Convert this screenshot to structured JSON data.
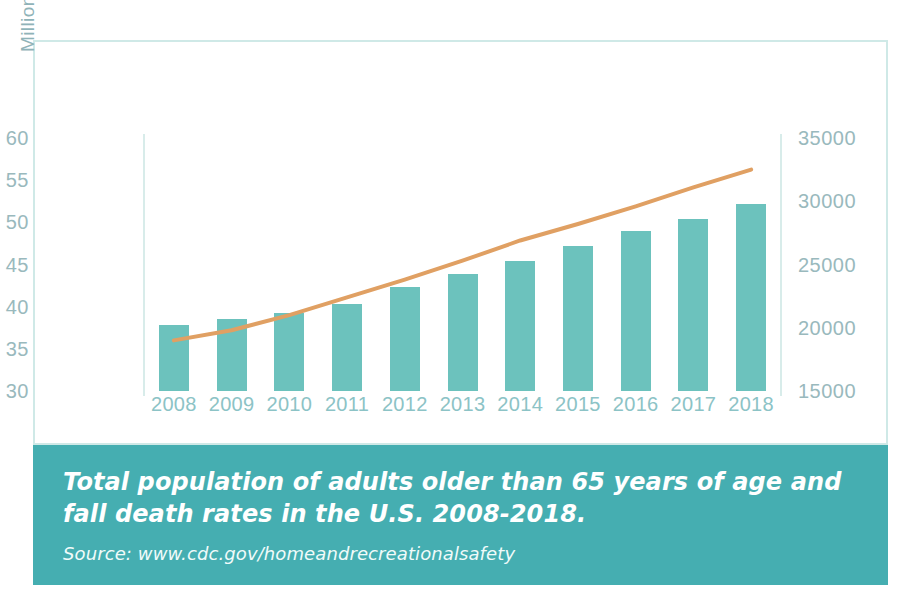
{
  "figure": {
    "caption_title": "Total population of adults older than 65 years of age and fall death rates in the U.S. 2008-2018.",
    "caption_source": "Source: www.cdc.gov/homeandrecreationalsafety"
  },
  "colors": {
    "bar": "#6cc2bd",
    "line": "#e0a063",
    "caption_background": "#45aeb1",
    "caption_text": "#ffffff",
    "axis_text": "#99b9bd",
    "xtick_text": "#8cc3c6",
    "frame": "#cfe9e7"
  },
  "chart_data": {
    "type": "bar",
    "title": "",
    "xlabel": "",
    "ylabel": "Millions",
    "categories": [
      "2008",
      "2009",
      "2010",
      "2011",
      "2012",
      "2013",
      "2014",
      "2015",
      "2016",
      "2017",
      "2018"
    ],
    "grid": false,
    "legend": "none",
    "series": [
      {
        "name": "Total population of adults older than 65 years of age",
        "type": "bar",
        "axis": "left",
        "unit": "Millions",
        "values": [
          37.8,
          38.5,
          39.2,
          40.3,
          42.3,
          43.9,
          45.4,
          47.2,
          49.0,
          50.4,
          52.2
        ]
      },
      {
        "name": "Fall death rates",
        "type": "line",
        "axis": "right",
        "unit": "deaths",
        "values": [
          19000,
          19800,
          21000,
          22400,
          23800,
          25300,
          26900,
          28200,
          29600,
          31100,
          32500
        ]
      }
    ],
    "y_axis_left": {
      "label": "Millions",
      "ticks": [
        "30",
        "35",
        "40",
        "45",
        "50",
        "55",
        "60"
      ],
      "tick_values": [
        30,
        35,
        40,
        45,
        50,
        55,
        60
      ],
      "ylim": [
        30,
        60
      ]
    },
    "y_axis_right": {
      "label": "",
      "ticks": [
        "15000",
        "20000",
        "25000",
        "30000",
        "35000"
      ],
      "tick_values": [
        15000,
        20000,
        25000,
        30000,
        35000
      ],
      "ylim": [
        15000,
        35000
      ]
    }
  }
}
